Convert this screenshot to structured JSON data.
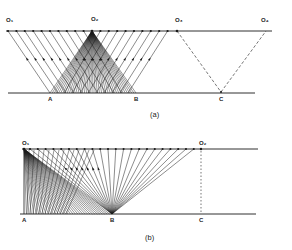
{
  "figure": {
    "panels": [
      {
        "id": "a",
        "caption": "(a)",
        "top_labels": [
          "O1",
          "O2",
          "O3",
          "O4"
        ],
        "bottom_labels": [
          "A",
          "B",
          "C"
        ],
        "description": "Surface line with source points; ray fan from O2 down to reflector A–B; parallel ray families; dashed V from O3 to C to O4"
      },
      {
        "id": "b",
        "caption": "(b)",
        "top_labels": [
          "O1",
          "O2"
        ],
        "bottom_labels": [
          "A",
          "B",
          "C"
        ],
        "description": "Surface line; dense ray fan from O1 to reflector A–B; rays from surface points converging to B; dashed vertical from O2 to C"
      }
    ],
    "labels": {
      "a_O1": "O₁",
      "a_O2": "O₂",
      "a_O3": "O₃",
      "a_O4": "O₄",
      "a_A": "A",
      "a_B": "B",
      "a_C": "C",
      "a_cap": "(a)",
      "b_O1": "O₁",
      "b_O2": "O₂",
      "b_A": "A",
      "b_B": "B",
      "b_C": "C",
      "b_cap": "(b)"
    },
    "colors": {
      "ink": "#1a1a1a",
      "background": "#ffffff"
    }
  }
}
